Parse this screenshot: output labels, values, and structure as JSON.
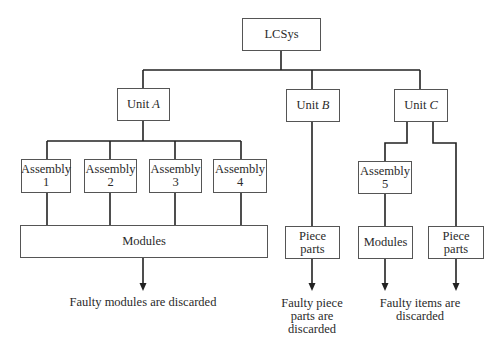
{
  "diagram": {
    "root": {
      "label": "LCSys"
    },
    "units": [
      {
        "prefix": "Unit",
        "letter": "A"
      },
      {
        "prefix": "Unit",
        "letter": "B"
      },
      {
        "prefix": "Unit",
        "letter": "C"
      }
    ],
    "assemblies": [
      {
        "line1": "Assembly",
        "line2": "1"
      },
      {
        "line1": "Assembly",
        "line2": "2"
      },
      {
        "line1": "Assembly",
        "line2": "3"
      },
      {
        "line1": "Assembly",
        "line2": "4"
      },
      {
        "line1": "Assembly",
        "line2": "5"
      }
    ],
    "bottom_boxes": {
      "unit_a_modules": "Modules",
      "unit_b_piece_parts": "Piece parts",
      "unit_c_modules": "Modules",
      "unit_c_piece_parts": "Piece parts"
    },
    "captions": {
      "unit_a": "Faulty modules are discarded",
      "unit_b": [
        "Faulty piece",
        "parts are",
        "discarded"
      ],
      "unit_c": [
        "Faulty items are",
        "discarded"
      ]
    },
    "colors": {
      "line": "#222222",
      "box_border": "#555555",
      "text": "#2a2a2a"
    }
  }
}
